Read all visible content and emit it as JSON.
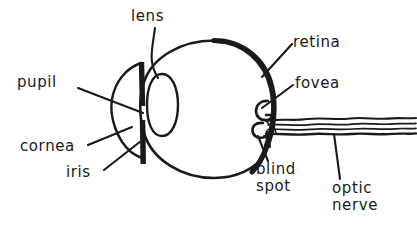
{
  "figure": {
    "type": "anatomical-diagram",
    "style": "hand-drawn ink line drawing",
    "background_color": "#ffffff",
    "ink_color": "#1a1a1a"
  },
  "labels": {
    "lens": "lens",
    "pupil": "pupil",
    "cornea": "cornea",
    "iris": "iris",
    "retina": "retina",
    "fovea": "fovea",
    "blind_spot_line1": "blind",
    "blind_spot_line2": "spot",
    "optic_nerve_line1": "optic",
    "optic_nerve_line2": "nerve"
  }
}
